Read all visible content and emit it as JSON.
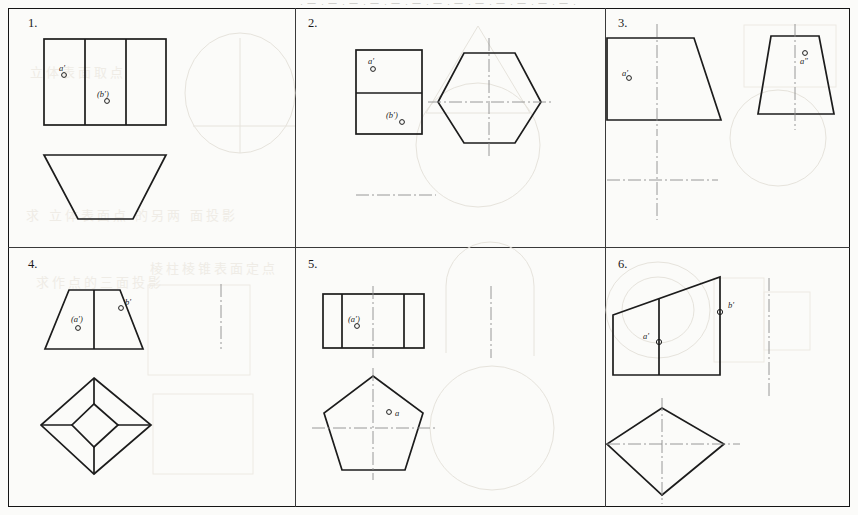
{
  "sheet": {
    "bleed_top_text": "· 一 · 一 · 一 · 一 · 一 · 一 · 一 · 一 · 一 · 一 · 一 · 一 · 一 ·",
    "bleed_left_upper": "立体表面取点",
    "bleed_left_lower": "求作点的三面投影",
    "bleed_mid_lower": "棱柱棱锥表面定点",
    "bleed_bottom": "求  立体表面点  的另两  面投影"
  },
  "panels": [
    {
      "id": "p1",
      "number": "1.",
      "labels": [
        {
          "text": "a′",
          "name": "point-label-a-prime"
        },
        {
          "text": "(b′)",
          "name": "point-label-b-prime-hidden"
        }
      ],
      "description": "three-division rectangle front view over inverted trapezoid top view"
    },
    {
      "id": "p2",
      "number": "2.",
      "labels": [
        {
          "text": "a′",
          "name": "point-label-a-prime"
        },
        {
          "text": "(b′)",
          "name": "point-label-b-prime-hidden"
        }
      ],
      "description": "two-division rectangle front view with hexagon top view"
    },
    {
      "id": "p3",
      "number": "3.",
      "labels": [
        {
          "text": "a′",
          "name": "point-label-a-prime"
        },
        {
          "text": "a″",
          "name": "point-label-a-double-prime"
        }
      ],
      "description": "wide trapezoid front view and narrow trapezoid side view"
    },
    {
      "id": "p4",
      "number": "4.",
      "labels": [
        {
          "text": "(a′)",
          "name": "point-label-a-prime-hidden"
        },
        {
          "text": "b′",
          "name": "point-label-b-prime"
        }
      ],
      "description": "divided trapezoid front view over square-pyramid diamond top view"
    },
    {
      "id": "p5",
      "number": "5.",
      "labels": [
        {
          "text": "(a′)",
          "name": "point-label-a-prime-hidden"
        },
        {
          "text": "a",
          "name": "point-label-a"
        }
      ],
      "description": "three-division rectangle front view over pentagon top view"
    },
    {
      "id": "p6",
      "number": "6.",
      "labels": [
        {
          "text": "a′",
          "name": "point-label-a-prime"
        },
        {
          "text": "b′",
          "name": "point-label-b-prime"
        }
      ],
      "description": "slanted-top wedge front view over diamond top view"
    }
  ]
}
